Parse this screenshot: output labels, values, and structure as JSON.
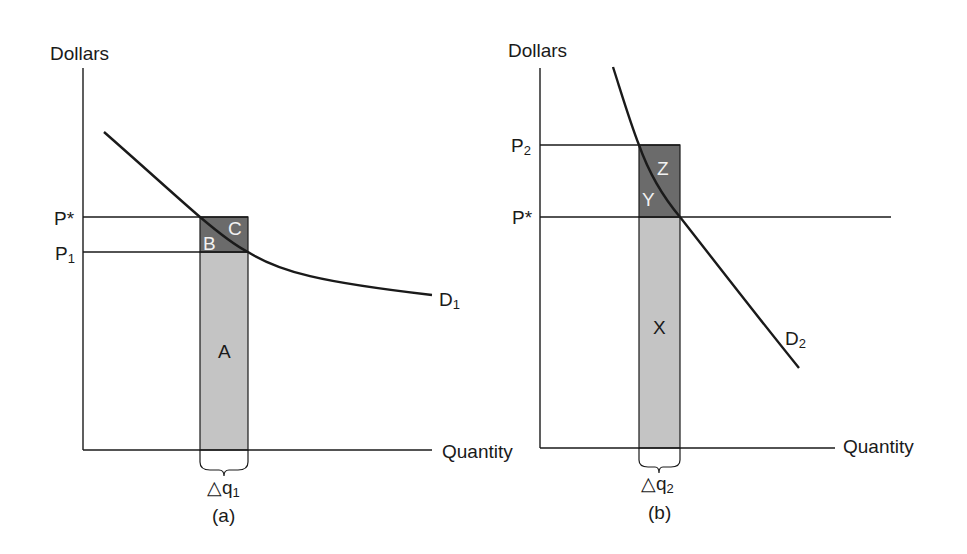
{
  "panels": [
    {
      "id": "a",
      "caption": "(a)",
      "y_axis_label": "Dollars",
      "x_axis_label": "Quantity",
      "price_labels": {
        "p_star": "P*",
        "p_low_main": "P",
        "p_low_sub": "1"
      },
      "curve_label": {
        "main": "D",
        "sub": "1"
      },
      "delta_label": {
        "main": "△q",
        "sub": "1"
      },
      "areas": {
        "a": "A",
        "b": "B",
        "c": "C"
      }
    },
    {
      "id": "b",
      "caption": "(b)",
      "y_axis_label": "Dollars",
      "x_axis_label": "Quantity",
      "price_labels": {
        "p_high_main": "P",
        "p_high_sub": "2",
        "p_star": "P*"
      },
      "curve_label": {
        "main": "D",
        "sub": "2"
      },
      "delta_label": {
        "main": "△q",
        "sub": "2"
      },
      "areas": {
        "x": "X",
        "y": "Y",
        "z": "Z"
      }
    }
  ],
  "colors": {
    "dark_region": "#6b6b6b",
    "light_region": "#c4c4c4",
    "line": "#1a1a1a"
  }
}
